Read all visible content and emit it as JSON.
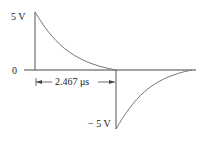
{
  "diagram": {
    "labels": {
      "pos_peak": "5 V",
      "zero": "0",
      "neg_peak": "− 5 V",
      "duration": "2.467 μs"
    },
    "colors": {
      "axis": "#444444",
      "curve": "#777777",
      "text": "#222222"
    }
  }
}
